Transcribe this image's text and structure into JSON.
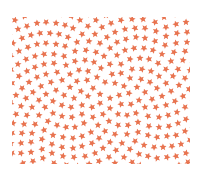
{
  "image": {
    "description": "Pattern of small coral and brownish-red stars arranged in a spiral on a white background",
    "background": "#ffffff",
    "field": {
      "x": 12,
      "y": 17,
      "width": 178,
      "height": 147
    },
    "center": {
      "x": 104,
      "y": 90
    },
    "star": {
      "size": 8,
      "spacing": 5.6,
      "count": 420
    },
    "palette": [
      "#e8734f",
      "#e06a4c",
      "#d9785a",
      "#c8614c",
      "#b85c4c",
      "#a85a4a",
      "#ec8a62"
    ]
  }
}
